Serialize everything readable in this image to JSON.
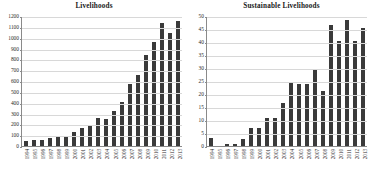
{
  "figure": {
    "background_color": "#ffffff",
    "bar_color": "#3a3a3a",
    "grid_color": "#d8d8d8",
    "axis_color": "#8a8a8a"
  },
  "panels": [
    {
      "id": "livelihoods",
      "title": "Livelihoods"
    },
    {
      "id": "sustainable-livelihoods",
      "title": "Sustainable Livelihoods"
    }
  ],
  "chart_data": [
    {
      "type": "bar",
      "title": "Livelihoods",
      "xlabel": "",
      "ylabel": "",
      "ylim": [
        0,
        1200
      ],
      "ytick_step": 100,
      "yticks": [
        0,
        100,
        200,
        300,
        400,
        500,
        600,
        700,
        800,
        900,
        1000,
        1100,
        1200
      ],
      "ytick_labels": [
        "0",
        "100",
        "200",
        "300",
        "400",
        "500",
        "600",
        "700",
        "800",
        "900",
        "1000",
        "1100",
        "1200"
      ],
      "grid": true,
      "legend": false,
      "categories": [
        "1994",
        "1995",
        "1996",
        "1997",
        "1998",
        "1999",
        "2000",
        "2001",
        "2002",
        "2003",
        "2004",
        "2005",
        "2006",
        "2007",
        "2008",
        "2009",
        "2010",
        "2011",
        "2012",
        "2013"
      ],
      "values": [
        50,
        52,
        53,
        78,
        85,
        88,
        132,
        168,
        192,
        262,
        252,
        320,
        405,
        570,
        655,
        840,
        960,
        1140,
        1045,
        1150
      ]
    },
    {
      "type": "bar",
      "title": "Sustainable Livelihoods",
      "xlabel": "",
      "ylabel": "",
      "ylim": [
        0,
        50
      ],
      "ytick_step": 5,
      "yticks": [
        0,
        5,
        10,
        15,
        20,
        25,
        30,
        35,
        40,
        45,
        50
      ],
      "ytick_labels": [
        "0",
        "5",
        "10",
        "15",
        "20",
        "25",
        "30",
        "35",
        "40",
        "45",
        "50"
      ],
      "grid": true,
      "legend": false,
      "categories": [
        "1994",
        "1995",
        "1996",
        "1997",
        "1998",
        "1999",
        "2000",
        "2001",
        "2002",
        "2003",
        "2004",
        "2005",
        "2006",
        "2007",
        "2008",
        "2009",
        "2010",
        "2011",
        "2012",
        "2013"
      ],
      "values": [
        3.0,
        0.0,
        0.8,
        0.8,
        2.8,
        6.8,
        6.8,
        10.8,
        10.8,
        16.7,
        24.8,
        23.7,
        23.7,
        29.6,
        21.3,
        46.7,
        40.3,
        48.5,
        40.2,
        45.4
      ]
    }
  ]
}
